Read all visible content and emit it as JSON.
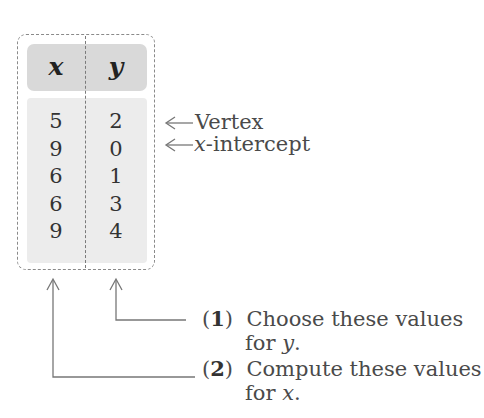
{
  "table": {
    "headers": [
      "x",
      "y"
    ],
    "rows": [
      {
        "x": "5",
        "y": "2"
      },
      {
        "x": "9",
        "y": "0"
      },
      {
        "x": "6",
        "y": "1"
      },
      {
        "x": "6",
        "y": "3"
      },
      {
        "x": "9",
        "y": "4"
      }
    ],
    "x_values": "5\n9\n6\n6\n9",
    "y_values": "2\n0\n1\n3\n4"
  },
  "row_labels": {
    "vertex": "Vertex",
    "x_intercept_var": "x",
    "x_intercept_rest": "-intercept"
  },
  "steps": [
    {
      "number": "1",
      "line1": "Choose these values",
      "line2_prefix": "for ",
      "var": "y",
      "line2_suffix": "."
    },
    {
      "number": "2",
      "line1": "Compute these values",
      "line2_prefix": "for ",
      "var": "x",
      "line2_suffix": "."
    }
  ],
  "colors": {
    "header_fill": "#d9d9d9",
    "body_fill": "#ececec",
    "border": "#8a8a8a",
    "text": "#3a3a3a"
  }
}
